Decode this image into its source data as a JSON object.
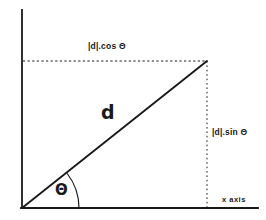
{
  "diagram": {
    "type": "vector-components",
    "background_color": "#ffffff",
    "stroke_color": "#1a1a1a",
    "axes": {
      "y_label": "y axis",
      "x_label": "x axis",
      "origin": {
        "x": 22,
        "y": 208
      },
      "y_axis_top": {
        "x": 22,
        "y": 10
      },
      "x_axis_right": {
        "x": 258,
        "y": 208
      }
    },
    "vector": {
      "label": "d",
      "start": {
        "x": 22,
        "y": 208
      },
      "end": {
        "x": 207,
        "y": 61
      }
    },
    "angle": {
      "label": "Θ",
      "arc_radius": 57,
      "vertex": {
        "x": 22,
        "y": 208
      }
    },
    "components": {
      "horizontal": {
        "label": "|d|.cos Θ",
        "guide_from": {
          "x": 22,
          "y": 61
        },
        "guide_to": {
          "x": 207,
          "y": 61
        },
        "style": "dashed"
      },
      "vertical": {
        "label": "|d|.sin Θ",
        "guide_from": {
          "x": 207,
          "y": 61
        },
        "guide_to": {
          "x": 207,
          "y": 208
        },
        "style": "dotted"
      }
    }
  }
}
